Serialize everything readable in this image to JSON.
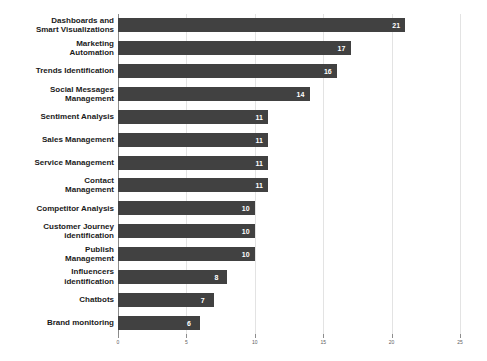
{
  "chart_data": {
    "type": "bar",
    "orientation": "horizontal",
    "title": "",
    "subtitle": "",
    "xlabel": "",
    "ylabel": "",
    "xlim": [
      0,
      25
    ],
    "ylim": null,
    "grid": true,
    "legend": null,
    "legend_position": "none",
    "bar_color": "#414141",
    "value_label_color": "#ffffff",
    "gridline_color": "#e3e3e3",
    "axis_color": "#8a8a8a",
    "xticks": [
      0,
      5,
      10,
      15,
      20,
      25
    ],
    "xtick_labels": [
      "0",
      "5",
      "10",
      "15",
      "20",
      "25"
    ],
    "categories": [
      "Dashboards and Smart Visualizations",
      "Marketing Automation",
      "Trends Identification",
      "Social Messages Management",
      "Sentiment Analysis",
      "Sales Management",
      "Service Management",
      "Contact Management",
      "Competitor Analysis",
      "Customer Journey identification",
      "Publish Management",
      "Influencers identification",
      "Chatbots",
      "Brand monitoring"
    ],
    "category_lines": [
      [
        "Dashboards and",
        "Smart Visualizations"
      ],
      [
        "Marketing",
        "Automation"
      ],
      [
        "Trends Identification"
      ],
      [
        "Social Messages",
        "Management"
      ],
      [
        "Sentiment Analysis"
      ],
      [
        "Sales Management"
      ],
      [
        "Service Management"
      ],
      [
        "Contact",
        "Management"
      ],
      [
        "Competitor Analysis"
      ],
      [
        "Customer Journey",
        "identification"
      ],
      [
        "Publish",
        "Management"
      ],
      [
        "Influencers",
        "identification"
      ],
      [
        "Chatbots"
      ],
      [
        "Brand monitoring"
      ]
    ],
    "values": [
      21,
      17,
      16,
      14,
      11,
      11,
      11,
      11,
      10,
      10,
      10,
      8,
      7,
      6
    ],
    "value_labels": [
      "21",
      "17",
      "16",
      "14",
      "11",
      "11",
      "11",
      "11",
      "10",
      "10",
      "10",
      "8",
      "7",
      "6"
    ]
  }
}
